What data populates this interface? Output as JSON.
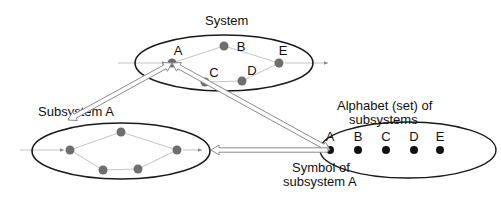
{
  "colors": {
    "background": "#ffffff",
    "ellipse_stroke": "#1a1a1a",
    "state_node": "#6e6e6e",
    "symbol_node": "#111111",
    "edge": "#c4c4c4",
    "arrow_fill": "#ffffff",
    "arrow_stroke": "#8a8a8a",
    "text": "#111111"
  },
  "system": {
    "title": "System",
    "ellipse": {
      "cx": 224,
      "cy": 63,
      "rx": 89,
      "ry": 28
    },
    "nodes": [
      {
        "id": "A",
        "label": "A",
        "x": 172,
        "y": 63,
        "lx": 178,
        "ly": 55
      },
      {
        "id": "B",
        "label": "B",
        "x": 224,
        "y": 46,
        "lx": 241,
        "ly": 51
      },
      {
        "id": "C",
        "label": "C",
        "x": 205,
        "y": 82,
        "lx": 214,
        "ly": 77
      },
      {
        "id": "D",
        "label": "D",
        "x": 242,
        "y": 81,
        "lx": 252,
        "ly": 75
      },
      {
        "id": "E",
        "label": "E",
        "x": 279,
        "y": 63,
        "lx": 283,
        "ly": 55
      }
    ],
    "edges": [
      [
        "A",
        "B"
      ],
      [
        "B",
        "E"
      ],
      [
        "A",
        "C"
      ],
      [
        "C",
        "D"
      ],
      [
        "D",
        "E"
      ]
    ],
    "input_from": {
      "x": 118,
      "y": 63
    },
    "output_to": {
      "x": 328,
      "y": 63
    }
  },
  "subsystem_a": {
    "title": "Subsystem A",
    "ellipse": {
      "cx": 121,
      "cy": 151,
      "rx": 89,
      "ry": 28
    },
    "nodes": [
      {
        "id": "s1",
        "x": 70,
        "y": 150
      },
      {
        "id": "s2",
        "x": 121,
        "y": 132
      },
      {
        "id": "s3",
        "x": 103,
        "y": 170
      },
      {
        "id": "s4",
        "x": 138,
        "y": 169
      },
      {
        "id": "s5",
        "x": 177,
        "y": 150
      }
    ],
    "edges": [
      [
        "s1",
        "s2"
      ],
      [
        "s2",
        "s5"
      ],
      [
        "s1",
        "s3"
      ],
      [
        "s3",
        "s4"
      ],
      [
        "s4",
        "s5"
      ]
    ],
    "input_from": {
      "x": 20,
      "y": 150
    },
    "output_to": {
      "x": 202,
      "y": 150
    }
  },
  "alphabet": {
    "title_line1": "Alphabet (set) of",
    "title_line2": "subsystems",
    "ellipse": {
      "cx": 408,
      "cy": 150,
      "rx": 88,
      "ry": 28
    },
    "symbols": [
      {
        "label": "A",
        "x": 330,
        "y": 150
      },
      {
        "label": "B",
        "x": 358,
        "y": 150
      },
      {
        "label": "C",
        "x": 386,
        "y": 150
      },
      {
        "label": "D",
        "x": 414,
        "y": 150
      },
      {
        "label": "E",
        "x": 440,
        "y": 150
      }
    ],
    "annotation_line1": "Symbol of",
    "annotation_line2": "subsystem A"
  },
  "arrows": [
    {
      "name": "system-a-to-subsystem-a",
      "x1": 172,
      "y1": 63,
      "x2": 68,
      "y2": 120,
      "heads": "both"
    },
    {
      "name": "system-a-to-symbol-a",
      "x1": 172,
      "y1": 63,
      "x2": 330,
      "y2": 150,
      "heads": "both"
    },
    {
      "name": "symbol-a-to-subsystem-a",
      "x1": 328,
      "y1": 150,
      "x2": 211,
      "y2": 150,
      "heads": "end"
    }
  ]
}
